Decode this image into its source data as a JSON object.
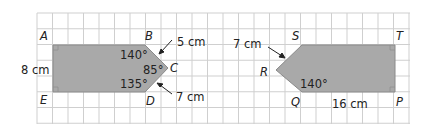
{
  "figure_left": {
    "vertices": {
      "A": "A",
      "B": "B",
      "C": "C",
      "D": "D",
      "E": "E"
    },
    "side_AE": "8 cm",
    "side_BC": "5 cm",
    "side_CD": "7 cm",
    "angle_B": "140°",
    "angle_C": "85°",
    "angle_D": "135°"
  },
  "figure_right": {
    "vertices": {
      "P": "P",
      "Q": "Q",
      "R": "R",
      "S": "S",
      "T": "T"
    },
    "side_RS": "7 cm",
    "side_QP": "16 cm",
    "angle_Q": "140°"
  },
  "colors": {
    "shape_fill": "#a9a9a9",
    "shape_stroke": "#8a8a8a",
    "grid": "#c8c8c8",
    "text": "#222222"
  }
}
